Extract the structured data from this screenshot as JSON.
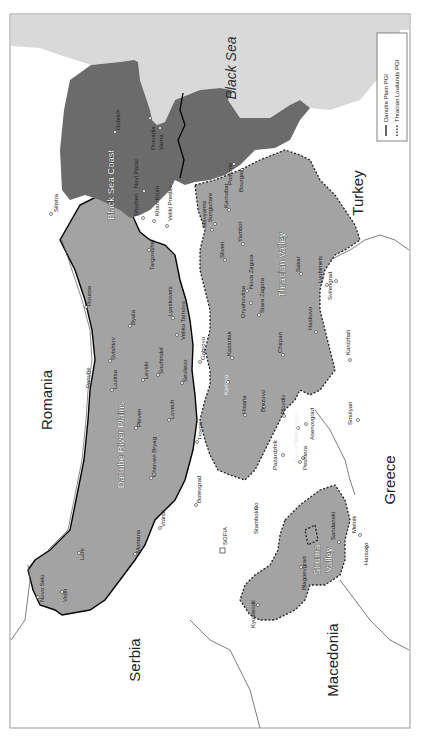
{
  "map": {
    "orientation": "rotated 90 degrees counter-clockwise",
    "colors": {
      "sea": "#d9d9d9",
      "danube_plain": "#a3a3a3",
      "black_sea_coast": "#6b6b6b",
      "thracian_lowlands": "#a3a3a3",
      "neighbouring_land": "#ffffff"
    },
    "countries": [
      {
        "id": "romania",
        "label": "Romania"
      },
      {
        "id": "serbia",
        "label": "Serbia"
      },
      {
        "id": "macedonia",
        "label": "Macedonia"
      },
      {
        "id": "greece",
        "label": "Greece"
      },
      {
        "id": "turkey",
        "label": "Turkey"
      }
    ],
    "seas": [
      {
        "id": "black-sea",
        "label": "Black Sea"
      }
    ],
    "rivers": [
      {
        "id": "danube",
        "label": "Danube"
      }
    ],
    "regions": [
      {
        "id": "danube-river-plains",
        "label": "Danube River Plains"
      },
      {
        "id": "black-sea-coast",
        "label": "Black Sea Coast"
      },
      {
        "id": "thracian-valley",
        "label": "Thracian Valley"
      },
      {
        "id": "struma-valley",
        "label": "Struma Valley"
      }
    ],
    "capital": {
      "label": "SOFIA"
    },
    "towns": {
      "danube": [
        "Novo Selo",
        "Vidin",
        "Lom",
        "Montana",
        "Vratsa",
        "Botevgrad",
        "Cherven Bryag",
        "Pleven",
        "Lovech",
        "Troyan",
        "Lozitsa",
        "Svishtov",
        "Levski",
        "Sevlievo",
        "Gabrovo",
        "Souhindol",
        "Byala",
        "Rousse",
        "Veliko Tarnovo",
        "Lyaskovets",
        "Targovishte"
      ],
      "coast": [
        "Silistra",
        "Shumen",
        "Novi Pazar",
        "Khan Krum",
        "Veliki Preslav",
        "Dobrich",
        "Provadia",
        "Varna",
        "Sungurlare",
        "Slavyantsi",
        "Karnobat",
        "Pomorie",
        "Bourgas"
      ],
      "thrace": [
        "Sliven",
        "Yambol",
        "Kazanlak",
        "Oryahovitsa",
        "Nova Zagora",
        "Stara Zagora",
        "Sakar",
        "Chirpan",
        "Lyubimets",
        "Svilengrad",
        "Haskovo",
        "Kardzhali",
        "Karlovo",
        "Hisaria",
        "Brezovo",
        "Plovdiv",
        "Pazardzhik",
        "Perushtitsa",
        "Peshtera",
        "Brestovitsa",
        "Asenovgrad",
        "Smolyan",
        "Stambolovo"
      ],
      "struma": [
        "Blagoevgrad",
        "Sandanski",
        "Melnik",
        "Harsovo",
        "Kyustendil"
      ]
    },
    "legend": {
      "items": [
        {
          "style": "solid",
          "label": "Danube Plain PGI"
        },
        {
          "style": "dotted",
          "label": "Thracian Lowlands PGI"
        }
      ]
    }
  }
}
